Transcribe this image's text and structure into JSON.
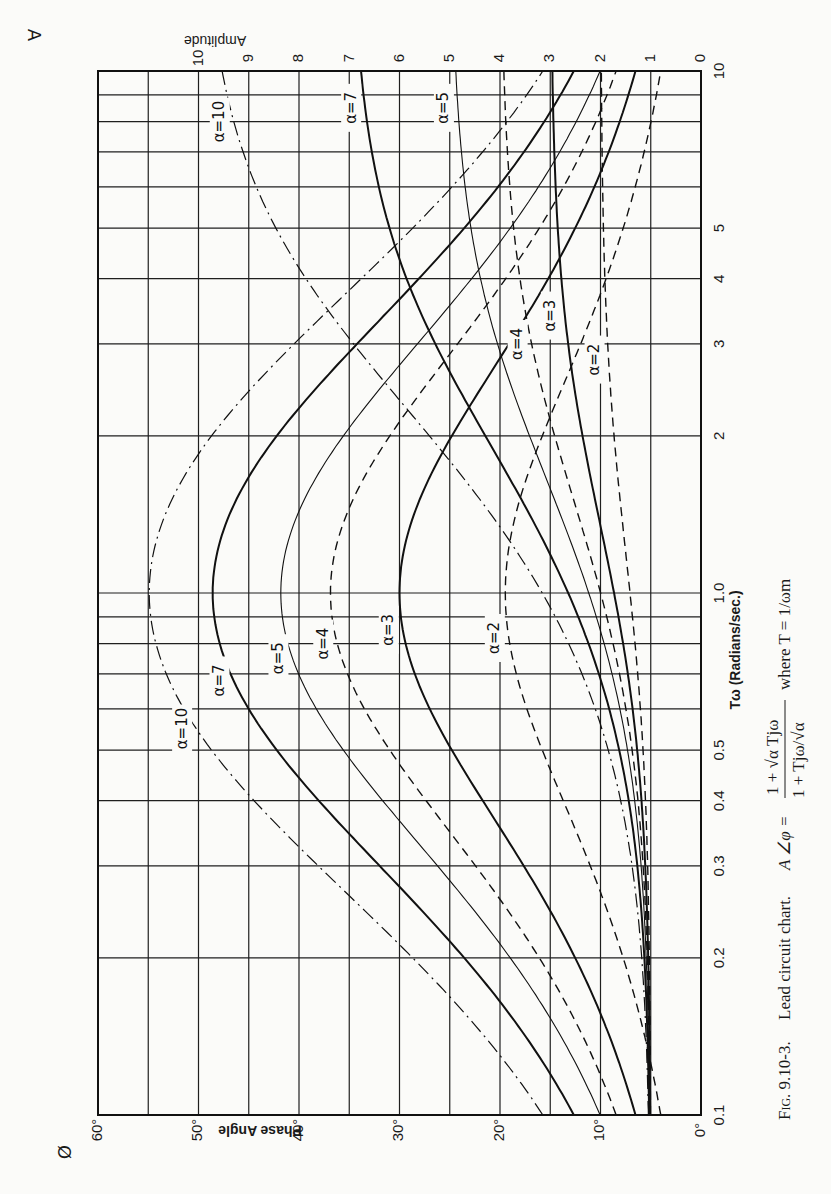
{
  "figure": {
    "caption": "Fig. 9.10-3.  Lead circuit chart.  A ∠φ = (1 + √α Tjω) / (1 + Tjω/√α)  where T = 1/ωm",
    "caption_parts": {
      "label": "Fig. 9.10-3.",
      "title": "Lead circuit chart.",
      "formula_lhs": "A ∠φ =",
      "numerator": "1 + √α Tjω",
      "denominator": "1 + Tjω/√α",
      "where": "where T = 1/ωm"
    },
    "corner_symbols": {
      "phase": "Ø",
      "amplitude": "A"
    },
    "colors": {
      "ink": "#111111",
      "paper": "#fbfbf9"
    }
  },
  "chart_data": {
    "type": "line",
    "title": "Lead circuit chart",
    "xlabel": "Tω (Radians/sec.)",
    "ylabel_left": "Phase Angle",
    "ylabel_right": "Amplitude",
    "x_scale": "log",
    "xlim": [
      0.1,
      10
    ],
    "x_ticks": [
      0.1,
      0.2,
      0.3,
      0.4,
      0.5,
      1.0,
      2,
      3,
      4,
      5,
      10
    ],
    "x_tick_labels": [
      "0.1",
      "0.2",
      "0.3",
      "0.4",
      "0.5",
      "1.0",
      "2",
      "3",
      "4",
      "5",
      "10"
    ],
    "phase_axis": {
      "range": [
        0,
        60
      ],
      "ticks": [
        0,
        10,
        20,
        30,
        40,
        50,
        60
      ],
      "tick_labels": [
        "0°",
        "10°",
        "20°",
        "30°",
        "40°",
        "50°",
        "60°"
      ]
    },
    "amplitude_axis": {
      "range": [
        0,
        12
      ],
      "ticks": [
        0,
        1,
        2,
        3,
        4,
        5,
        6,
        7,
        8,
        9,
        10
      ],
      "tick_labels": [
        "0",
        "1",
        "2",
        "3",
        "4",
        "5",
        "6",
        "7",
        "8",
        "9",
        "10"
      ]
    },
    "grid": true,
    "orientation_note": "printed page rotated 90°: Tω runs vertically (10 at top, 0.1 at bottom)",
    "series": [
      {
        "name": "α=2",
        "alpha": 2,
        "style": "dashed",
        "phase_peak_deg": 19.5,
        "x": [
          0.1,
          0.2,
          0.5,
          1.0,
          2,
          5,
          10
        ],
        "phase_deg": [
          5.7,
          10.9,
          18.4,
          19.5,
          18.4,
          10.9,
          5.7
        ],
        "amplitude": [
          1.01,
          1.03,
          1.14,
          1.41,
          1.75,
          1.96,
          1.99
        ]
      },
      {
        "name": "α=3",
        "alpha": 3,
        "style": "solid",
        "phase_peak_deg": 30.0,
        "x": [
          0.1,
          0.2,
          0.5,
          1.0,
          2,
          5,
          10
        ],
        "phase_deg": [
          11.3,
          20.5,
          30.0,
          30.0,
          30.0,
          20.5,
          11.3
        ],
        "amplitude": [
          1.01,
          1.05,
          1.24,
          1.73,
          2.42,
          2.89,
          2.97
        ]
      },
      {
        "name": "α=4",
        "alpha": 4,
        "style": "dashed",
        "phase_peak_deg": 36.9,
        "x": [
          0.1,
          0.2,
          0.5,
          1.0,
          2,
          5,
          10
        ],
        "phase_deg": [
          8.5,
          16.3,
          30.9,
          36.9,
          30.9,
          16.3,
          8.5
        ],
        "amplitude": [
          1.01,
          1.07,
          1.31,
          2.0,
          3.06,
          3.86,
          3.96
        ]
      },
      {
        "name": "α=5",
        "alpha": 5,
        "style": "thin",
        "phase_peak_deg": 41.8,
        "x": [
          0.1,
          0.2,
          0.5,
          1.0,
          2,
          5,
          10
        ],
        "phase_deg": [
          10.1,
          19.2,
          35.4,
          41.8,
          35.4,
          19.2,
          10.1
        ],
        "amplitude": [
          1.01,
          1.09,
          1.37,
          2.24,
          3.65,
          4.83,
          4.96
        ]
      },
      {
        "name": "α=7",
        "alpha": 7,
        "style": "solid",
        "phase_peak_deg": 48.6,
        "x": [
          0.1,
          0.2,
          0.5,
          1.0,
          2,
          5,
          10
        ],
        "phase_deg": [
          13.0,
          24.2,
          41.7,
          48.6,
          41.7,
          24.2,
          13.0
        ],
        "amplitude": [
          1.02,
          1.13,
          1.47,
          2.65,
          4.74,
          6.77,
          6.94
        ]
      },
      {
        "name": "α=10",
        "alpha": 10,
        "style": "dashdot",
        "phase_peak_deg": 54.9,
        "x": [
          0.1,
          0.2,
          0.5,
          1.0,
          2,
          5,
          10
        ],
        "phase_deg": [
          16.5,
          29.7,
          47.7,
          54.9,
          47.7,
          29.7,
          16.5
        ],
        "amplitude": [
          1.02,
          1.16,
          1.58,
          3.16,
          6.32,
          9.01,
          9.54
        ]
      }
    ],
    "curve_labels": [
      {
        "text": "α=10",
        "on": "phase",
        "x": 0.55,
        "alpha": 10
      },
      {
        "text": "α=7",
        "on": "phase",
        "x": 0.68,
        "alpha": 7
      },
      {
        "text": "α=5",
        "on": "phase",
        "x": 0.75,
        "alpha": 5
      },
      {
        "text": "α=4",
        "on": "phase",
        "x": 0.8,
        "alpha": 4
      },
      {
        "text": "α=3",
        "on": "phase",
        "x": 0.85,
        "alpha": 3
      },
      {
        "text": "α=2",
        "on": "phase",
        "x": 0.82,
        "alpha": 2
      },
      {
        "text": "α=10",
        "on": "amplitude",
        "x": 8.0,
        "alpha": 10
      },
      {
        "text": "α=7",
        "on": "amplitude",
        "x": 8.5,
        "alpha": 7
      },
      {
        "text": "α=5",
        "on": "amplitude",
        "x": 8.5,
        "alpha": 5
      },
      {
        "text": "α=4",
        "on": "amplitude",
        "x": 3.0,
        "alpha": 4
      },
      {
        "text": "α=3",
        "on": "amplitude",
        "x": 3.4,
        "alpha": 3
      },
      {
        "text": "α=2",
        "on": "amplitude",
        "x": 2.8,
        "alpha": 2
      }
    ]
  }
}
